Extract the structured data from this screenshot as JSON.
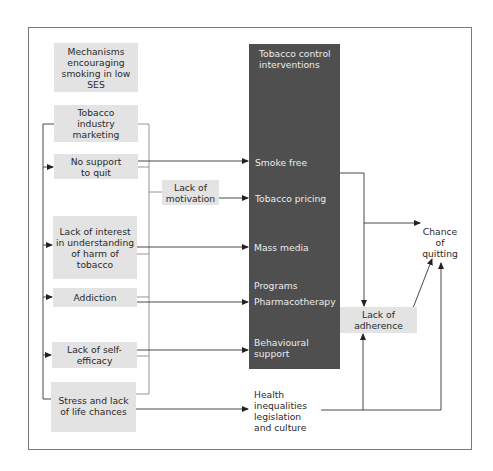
{
  "diagram": {
    "mechanisms_header": "Mechanisms\nencouraging\nsmoking in low\nSES",
    "mechanisms": [
      {
        "id": "tobacco-industry-marketing",
        "label": "Tobacco\nindustry\nmarketing"
      },
      {
        "id": "no-support-to-quit",
        "label": "No support\nto quit"
      },
      {
        "id": "lack-of-interest",
        "label": "Lack of interest\nin understanding\nof harm of\ntobacco"
      },
      {
        "id": "addiction",
        "label": "Addiction"
      },
      {
        "id": "lack-of-self-efficacy",
        "label": "Lack of self-\nefficacy"
      },
      {
        "id": "stress",
        "label": "Stress and lack\nof life chances"
      }
    ],
    "lack_of_motivation": "Lack of\nmotivation",
    "interventions": {
      "header": "Tobacco control\ninterventions",
      "items": [
        {
          "id": "smoke-free",
          "label": "Smoke free"
        },
        {
          "id": "tobacco-pricing",
          "label": "Tobacco pricing"
        },
        {
          "id": "mass-media",
          "label": "Mass media"
        },
        {
          "id": "programs",
          "label": "Programs"
        },
        {
          "id": "pharmacotherapy",
          "label": "Pharmacotherapy"
        },
        {
          "id": "behavioural-support",
          "label": "Behavioural\nsupport"
        }
      ]
    },
    "health_inequalities": "Health\ninequalities\nlegislation\nand culture",
    "lack_of_adherence": "Lack of\nadherence",
    "outcome": "Chance\nof\nquitting",
    "colors": {
      "box_fill": "#e3e3e3",
      "panel_fill": "#4f4f4f",
      "panel_text": "#ececec",
      "line": "#333333",
      "frame": "#7a7a7a"
    }
  }
}
